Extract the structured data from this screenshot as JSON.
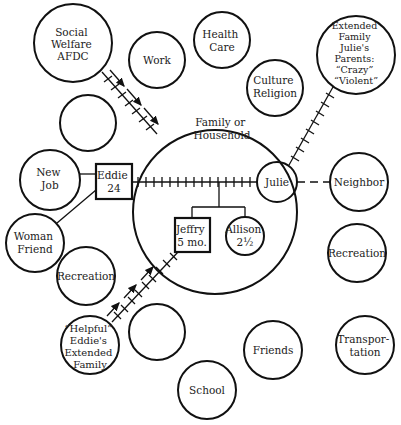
{
  "diagram": {
    "type": "ecomap",
    "center": {
      "label_lines": [
        "Family or",
        "Household"
      ]
    },
    "family_members": [
      {
        "id": "eddie",
        "shape": "square",
        "label_lines": [
          "Eddie",
          "24"
        ]
      },
      {
        "id": "julie",
        "shape": "circle",
        "label_lines": [
          "Julie"
        ]
      },
      {
        "id": "jeffry",
        "shape": "square",
        "label_lines": [
          "Jeffry",
          "5 mo."
        ]
      },
      {
        "id": "allison",
        "shape": "circle",
        "label_lines": [
          "Allison",
          "2½"
        ]
      }
    ],
    "systems": [
      {
        "id": "social-welfare",
        "label_lines": [
          "Social",
          "Welfare",
          "AFDC"
        ]
      },
      {
        "id": "work",
        "label_lines": [
          "Work"
        ]
      },
      {
        "id": "health-care",
        "label_lines": [
          "Health",
          "Care"
        ]
      },
      {
        "id": "culture-religion",
        "label_lines": [
          "Culture",
          "Religion"
        ]
      },
      {
        "id": "julies-parents",
        "label_lines": [
          "Extended",
          "Family",
          "Julie's",
          "Parents:",
          "“Crazy”",
          "“Violent”"
        ]
      },
      {
        "id": "empty-upper-left",
        "label_lines": []
      },
      {
        "id": "new-job",
        "label_lines": [
          "New",
          "Job"
        ]
      },
      {
        "id": "neighbor",
        "label_lines": [
          "Neighbor"
        ]
      },
      {
        "id": "woman-friend",
        "label_lines": [
          "Woman",
          "Friend"
        ]
      },
      {
        "id": "recreation-left",
        "label_lines": [
          "Recreation"
        ]
      },
      {
        "id": "recreation-right",
        "label_lines": [
          "Recreation"
        ]
      },
      {
        "id": "eddies-family",
        "label_lines": [
          "“Helpful”",
          "Eddie's",
          "Extended",
          "Family"
        ]
      },
      {
        "id": "empty-lower",
        "label_lines": []
      },
      {
        "id": "friends",
        "label_lines": [
          "Friends"
        ]
      },
      {
        "id": "transportation",
        "label_lines": [
          "Transpor-",
          "tation"
        ]
      },
      {
        "id": "school",
        "label_lines": [
          "School"
        ]
      }
    ],
    "connections": [
      {
        "from": "social-welfare",
        "to": "household",
        "style": "stressful",
        "arrow": "toward household"
      },
      {
        "from": "julies-parents",
        "to": "julie",
        "style": "stressful"
      },
      {
        "from": "eddie",
        "to": "julie",
        "style": "stressful"
      },
      {
        "from": "julie",
        "to": "neighbor",
        "style": "tenuous"
      },
      {
        "from": "eddie",
        "to": "new-job",
        "style": "ordinary"
      },
      {
        "from": "eddie",
        "to": "woman-friend",
        "style": "ordinary"
      },
      {
        "from": "eddies-family",
        "to": "jeffry",
        "style": "stressful",
        "arrow": "toward household"
      }
    ]
  }
}
